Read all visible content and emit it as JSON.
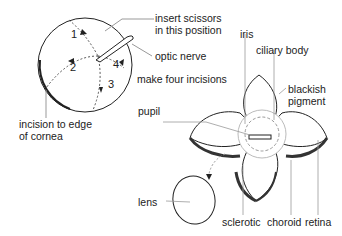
{
  "diagram": {
    "left_figure": {
      "steps": [
        "1",
        "2",
        "3",
        "4"
      ],
      "labels": {
        "insert_scissors": [
          "insert scissors",
          "in this position"
        ],
        "optic_nerve": "optic nerve",
        "make_incisions": "make four incisions",
        "incision_edge": [
          "incision to edge",
          "of cornea"
        ]
      }
    },
    "right_figure": {
      "labels": {
        "iris": "iris",
        "ciliary_body": "ciliary body",
        "blackish_pigment": [
          "blackish",
          "pigment"
        ],
        "pupil": "pupil",
        "lens": "lens",
        "sclerotic": "sclerotic",
        "choroid": "choroid",
        "retina": "retina"
      }
    },
    "colors": {
      "line": "#222222",
      "dashed": "#555555",
      "pigment": "#333333"
    }
  }
}
